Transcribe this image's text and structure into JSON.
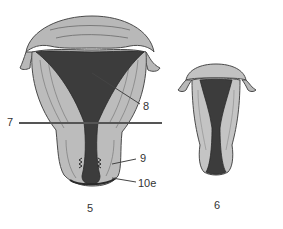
{
  "diagram": {
    "type": "anatomical-illustration",
    "colors": {
      "tissue": "#b5b5b5",
      "tissue_light": "#c8c8c8",
      "cavity": "#3c3c3c",
      "outline": "#4a4a4a",
      "line": "#555555",
      "label": "#333333"
    },
    "figures": [
      {
        "id": "fig-5",
        "caption": "5"
      },
      {
        "id": "fig-6",
        "caption": "6"
      }
    ],
    "labels": [
      {
        "id": "label-7",
        "text": "7"
      },
      {
        "id": "label-8",
        "text": "8"
      },
      {
        "id": "label-9",
        "text": "9"
      },
      {
        "id": "label-10e",
        "text": "10e"
      }
    ]
  }
}
